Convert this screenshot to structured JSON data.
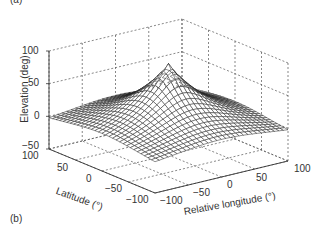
{
  "panel_labels": {
    "top": "(a)",
    "bottom": "(b)"
  },
  "chart_data": {
    "type": "surface",
    "title": "",
    "xlabel": "Relative longitude (°)",
    "ylabel": "Latitude (°)",
    "zlabel": "Elevation (deg)",
    "xlim": [
      -100,
      100
    ],
    "ylim": [
      -100,
      100
    ],
    "zlim": [
      -50,
      100
    ],
    "xticks": [
      -100,
      -50,
      0,
      50,
      100
    ],
    "yticks": [
      -100,
      -50,
      0,
      50,
      100
    ],
    "zticks": [
      -50,
      0,
      50,
      100
    ],
    "grid": true,
    "grid_style": "dashed",
    "surface": {
      "description": "Satellite elevation angle vs relative longitude and latitude; peak ~90 deg at (0,0), falling to about -10 deg at corners",
      "peak": {
        "lon": 0,
        "lat": 0,
        "elevation": 90
      },
      "corner_elevation": -10,
      "mesh_steps": 30,
      "edge_color": "#222222",
      "face_color": "#ffffff"
    }
  },
  "tick_labels": {
    "z": [
      "100",
      "50",
      "0",
      "−50"
    ],
    "lat": [
      "100",
      "50",
      "0",
      "−50",
      "−100"
    ],
    "lon": [
      "−100",
      "−50",
      "0",
      "50",
      "100"
    ]
  },
  "axis_labels": {
    "z": "Elevation (deg)",
    "lat": "Latitude (°)",
    "lon": "Relative longitude (°)"
  }
}
